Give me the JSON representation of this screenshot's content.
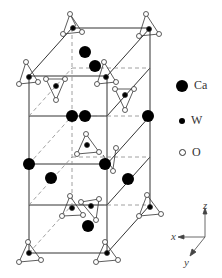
{
  "figure": {
    "type": "crystal-structure-unit-cell",
    "compound_atoms": [
      "Ca",
      "W",
      "O"
    ],
    "legend": [
      {
        "symbol": "large-black-circle",
        "label": "Ca"
      },
      {
        "symbol": "small-black-dot",
        "label": "W"
      },
      {
        "symbol": "small-open-circle",
        "label": "O"
      }
    ],
    "axes": {
      "z": "z",
      "x": "x",
      "y": "y"
    },
    "colors": {
      "line": "#333333",
      "atom_fill": "#000000",
      "oxygen_fill": "#ffffff",
      "dashed": "#777777"
    }
  }
}
